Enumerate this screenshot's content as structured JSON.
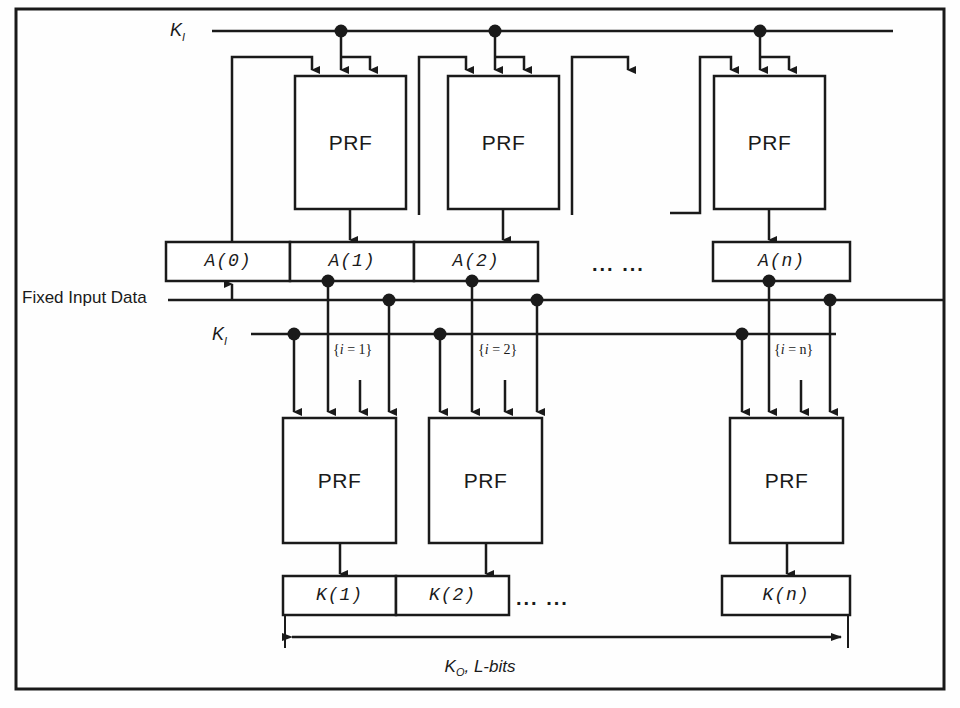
{
  "figure": {
    "title_text": "",
    "kind": "block-diagram",
    "stroke_color": "#1a1a1a",
    "background_color": "#fefefe"
  },
  "labels": {
    "key_input_top": "K",
    "key_input_top_sub": "I",
    "key_input_mid": "K",
    "key_input_mid_sub": "I",
    "fixed_input_data": "Fixed Input Data",
    "output_key": "K",
    "output_key_sub": "O",
    "output_key_rest": ", L-bits",
    "ellipsis": "... ...",
    "prf": "PRF"
  },
  "stage_a": {
    "prf_label": "PRF",
    "blocks": [
      {
        "name": "prf-a1",
        "label": "PRF"
      },
      {
        "name": "prf-a2",
        "label": "PRF"
      },
      {
        "name": "prf-an",
        "label": "PRF"
      }
    ],
    "registers": [
      {
        "name": "reg-a0",
        "label": "A(0)"
      },
      {
        "name": "reg-a1",
        "label": "A(1)"
      },
      {
        "name": "reg-a2",
        "label": "A(2)"
      },
      {
        "name": "reg-an",
        "label": "A(n)"
      }
    ],
    "ellipsis": "... ..."
  },
  "stage_k": {
    "prf_label": "PRF",
    "blocks": [
      {
        "name": "prf-k1",
        "label": "PRF"
      },
      {
        "name": "prf-k2",
        "label": "PRF"
      },
      {
        "name": "prf-kn",
        "label": "PRF"
      }
    ],
    "registers": [
      {
        "name": "reg-k1",
        "label": "K(1)"
      },
      {
        "name": "reg-k2",
        "label": "K(2)"
      },
      {
        "name": "reg-kn",
        "label": "K(n)"
      }
    ],
    "index_labels": [
      {
        "name": "index-i-1",
        "prefix": "{",
        "var": "i",
        "value": " = 1}"
      },
      {
        "name": "index-i-2",
        "prefix": "{",
        "var": "i",
        "value": " = 2}"
      },
      {
        "name": "index-i-n",
        "prefix": "{",
        "var": "i",
        "value": " = n}"
      }
    ],
    "ellipsis": "... ..."
  },
  "measure": {
    "label_k": "K",
    "label_k_sub": "O",
    "label_rest": ", L-bits"
  }
}
